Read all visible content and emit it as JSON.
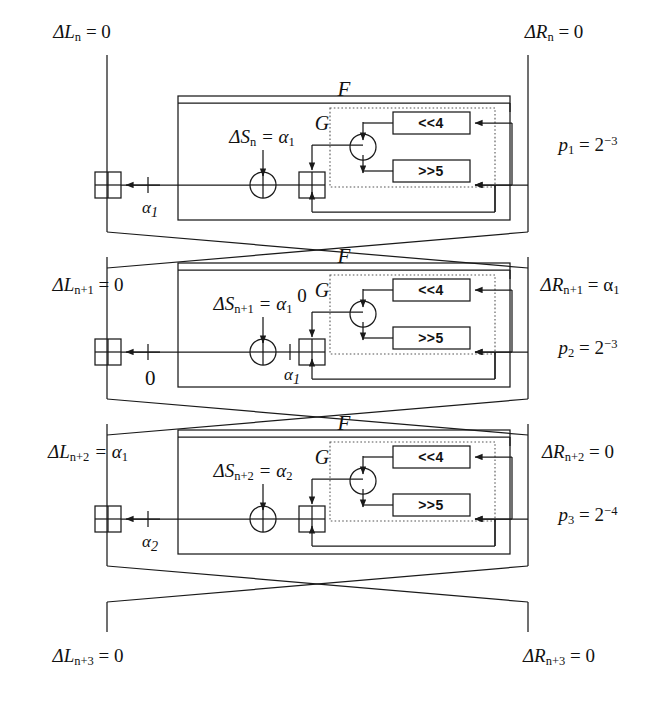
{
  "diagram": {
    "top_labels": {
      "left": "ΔL",
      "left_sub": "n",
      "left_eq": "= 0",
      "right": "ΔR",
      "right_sub": "n",
      "right_eq": "= 0"
    },
    "bottom_labels": {
      "left": "ΔL",
      "left_sub": "n+3",
      "left_eq": "= 0",
      "right": "ΔR",
      "right_sub": "n+3",
      "right_eq": "= 0"
    },
    "block_labels": {
      "f": "F",
      "g": "G",
      "shift_left": "<<4",
      "shift_right": ">>5"
    },
    "rounds": [
      {
        "index": 1,
        "left_input": "ΔL",
        "left_input_sub": "n",
        "left_input_eq": "= 0",
        "right_input": "ΔR",
        "right_input_sub": "n",
        "right_input_eq": "= 0",
        "delta_s": "ΔS",
        "delta_s_sub": "n",
        "delta_s_eq": "= α",
        "delta_s_eq_sub": "1",
        "left_wire_label": "α",
        "left_wire_label_sub": "1",
        "mid_wire_label": "",
        "mid_wire_label_sub": "",
        "g_in_label": "",
        "probability": "p",
        "probability_sub": "1",
        "probability_eq": "= 2",
        "probability_exp": "−3"
      },
      {
        "index": 2,
        "left_input": "ΔL",
        "left_input_sub": "n+1",
        "left_input_eq": "= 0",
        "right_input": "ΔR",
        "right_input_sub": "n+1",
        "right_input_eq": "= α",
        "right_input_eq_sub": "1",
        "delta_s": "ΔS",
        "delta_s_sub": "n+1",
        "delta_s_eq": "= α",
        "delta_s_eq_sub": "1",
        "left_wire_label": "0",
        "left_wire_label_sub": "",
        "mid_wire_label": "α",
        "mid_wire_label_sub": "1",
        "g_in_label": "0",
        "probability": "p",
        "probability_sub": "2",
        "probability_eq": "= 2",
        "probability_exp": "−3"
      },
      {
        "index": 3,
        "left_input": "ΔL",
        "left_input_sub": "n+2",
        "left_input_eq": "= α",
        "left_input_eq_sub": "1",
        "right_input": "ΔR",
        "right_input_sub": "n+2",
        "right_input_eq": "= 0",
        "delta_s": "ΔS",
        "delta_s_sub": "n+2",
        "delta_s_eq": "= α",
        "delta_s_eq_sub": "2",
        "left_wire_label": "α",
        "left_wire_label_sub": "2",
        "mid_wire_label": "",
        "mid_wire_label_sub": "",
        "g_in_label": "",
        "probability": "p",
        "probability_sub": "3",
        "probability_eq": "= 2",
        "probability_exp": "−4"
      }
    ],
    "colors": {
      "line": "#1a1a1a",
      "dotted": "#555555",
      "text": "#111111",
      "background": "#ffffff"
    }
  }
}
